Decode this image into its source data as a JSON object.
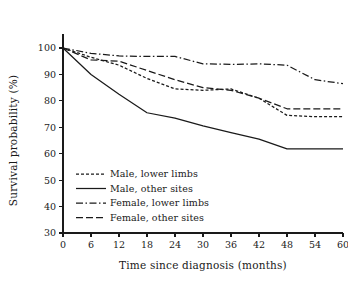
{
  "chart_data": {
    "type": "line",
    "title": "",
    "xlabel": "Time since diagnosis (months)",
    "ylabel": "Survival probability (%)",
    "xlim": [
      0,
      60
    ],
    "ylim": [
      30,
      100
    ],
    "xticks": [
      0,
      6,
      12,
      18,
      24,
      30,
      36,
      42,
      48,
      54,
      60
    ],
    "yticks": [
      30,
      40,
      50,
      60,
      70,
      80,
      90,
      100
    ],
    "grid": false,
    "legend_position": "lower-left-inside",
    "x": [
      0,
      6,
      12,
      18,
      24,
      30,
      36,
      42,
      48,
      54,
      60
    ],
    "series": [
      {
        "name": "Male, lower limbs",
        "dash": "3,2",
        "color": "#1a1a1a",
        "values": [
          100,
          96.5,
          93.5,
          88.5,
          84.5,
          84.0,
          84.5,
          81.0,
          74.5,
          74.0,
          74.0
        ]
      },
      {
        "name": "Male, other sites",
        "dash": "none",
        "color": "#1a1a1a",
        "values": [
          100,
          90.0,
          82.5,
          75.5,
          73.5,
          70.5,
          68.0,
          65.5,
          61.8,
          61.8,
          61.8
        ]
      },
      {
        "name": "Female, lower limbs",
        "dash": "7,2.5,1.5,2.5",
        "color": "#1a1a1a",
        "values": [
          100,
          98.0,
          97.0,
          96.8,
          96.8,
          94.0,
          93.8,
          94.0,
          93.5,
          88.0,
          86.5
        ]
      },
      {
        "name": "Female, other sites",
        "dash": "7,3",
        "color": "#1a1a1a",
        "values": [
          100,
          95.5,
          95.0,
          91.5,
          88.0,
          85.0,
          84.0,
          81.0,
          77.0,
          77.0,
          77.0
        ]
      }
    ]
  },
  "legend": {
    "items": [
      {
        "label": "Male, lower limbs"
      },
      {
        "label": "Male, other sites"
      },
      {
        "label": "Female, lower limbs"
      },
      {
        "label": "Female, other sites"
      }
    ]
  },
  "axes": {
    "y_title": "Survival probability (%)",
    "x_title": "Time since diagnosis (months)"
  }
}
